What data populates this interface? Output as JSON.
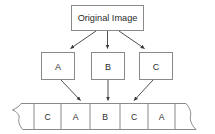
{
  "diagram": {
    "type": "flow-diagram",
    "background_color": "#ffffff",
    "stroke_color": "#8a8a8a",
    "arrow_color": "#3a3a3a",
    "text_color": "#2b2b2b",
    "source": {
      "label": "Original Image",
      "shape": "rectangle"
    },
    "parts": [
      {
        "label": "A",
        "shape": "rectangle"
      },
      {
        "label": "B",
        "shape": "rectangle"
      },
      {
        "label": "C",
        "shape": "rectangle"
      }
    ],
    "stream": {
      "shape": "torn-edge-strip",
      "left_edge": "jagged",
      "right_edge": "jagged",
      "cells": [
        {
          "label": "C"
        },
        {
          "label": "A"
        },
        {
          "label": "B"
        },
        {
          "label": "C"
        },
        {
          "label": "A"
        }
      ]
    },
    "arrows": [
      {
        "from": "Original Image",
        "to": "A",
        "style": "diagonal-down-left"
      },
      {
        "from": "Original Image",
        "to": "B",
        "style": "straight-down"
      },
      {
        "from": "Original Image",
        "to": "C",
        "style": "diagonal-down-right"
      },
      {
        "from": "A",
        "to": "stream-cell-2",
        "style": "diagonal-down-right"
      },
      {
        "from": "B",
        "to": "stream-cell-3",
        "style": "straight-down"
      },
      {
        "from": "C",
        "to": "stream-cell-4",
        "style": "diagonal-down-left"
      }
    ]
  }
}
